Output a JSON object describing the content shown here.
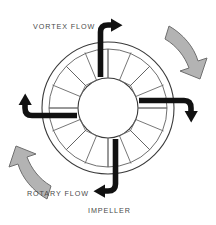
{
  "figure": {
    "background_color": "#ffffff"
  },
  "labels": {
    "vortex_flow": "VORTEX FLOW",
    "rotary_flow": "ROTARY FLOW",
    "impeller": "IMPELLER"
  },
  "colors": {
    "outline": "#3a3a3a",
    "vortex_arrow": "#111111",
    "rotary_arrow_fill": "#b3b3b3",
    "rotary_arrow_stroke": "#6e6e6e",
    "label_text": "#4a4a4a",
    "background": "#ffffff"
  },
  "impeller": {
    "center_x": 108,
    "center_y": 108,
    "outer_radius": 66,
    "ring_radius": 59,
    "hub_radius": 30,
    "blade_count": 16,
    "description": "Annular impeller wheel with radial blades"
  },
  "vortex_arrows": [
    {
      "name": "top-vortex-arrow",
      "position": "top",
      "direction": "up-and-over-right"
    },
    {
      "name": "right-vortex-arrow",
      "position": "right",
      "direction": "out-and-curl-down"
    },
    {
      "name": "bottom-vortex-arrow",
      "position": "bottom",
      "direction": "down-and-over-left"
    },
    {
      "name": "left-vortex-arrow",
      "position": "left",
      "direction": "out-and-curl-up"
    }
  ],
  "rotary_arrows": [
    {
      "name": "upper-right-rotary-arrow",
      "position": "upper-right",
      "direction": "clockwise"
    },
    {
      "name": "lower-left-rotary-arrow",
      "position": "lower-left",
      "direction": "clockwise"
    }
  ]
}
